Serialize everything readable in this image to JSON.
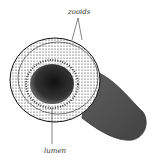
{
  "figure": {
    "labels": {
      "zooids": "zooids",
      "lumen": "lumen"
    },
    "colors": {
      "ink": "#1a1a1a",
      "background": "#ffffff"
    }
  }
}
